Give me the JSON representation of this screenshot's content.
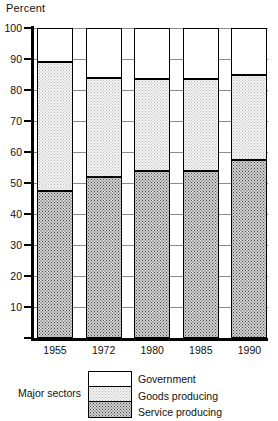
{
  "chart_data": {
    "type": "bar",
    "subtype": "stacked-100-percent",
    "title": "",
    "xlabel": "",
    "ylabel": "Percent",
    "ylim": [
      0,
      100
    ],
    "yticks": [
      0,
      10,
      20,
      30,
      40,
      50,
      60,
      70,
      80,
      90,
      100
    ],
    "ytick_labels": [
      "",
      "10",
      "20",
      "30",
      "40",
      "50",
      "60",
      "70",
      "80",
      "90",
      "100"
    ],
    "grid": true,
    "legend_position": "below",
    "legend_title": "Major sectors",
    "categories": [
      "1955",
      "1972",
      "1980",
      "1985",
      "1990"
    ],
    "series": [
      {
        "name": "Service producing",
        "fill": "dark-stipple",
        "values": [
          47.5,
          52.0,
          54.0,
          54.0,
          57.5
        ]
      },
      {
        "name": "Goods producing",
        "fill": "light-stipple",
        "values": [
          41.5,
          32.0,
          29.5,
          29.5,
          27.5
        ]
      },
      {
        "name": "Government",
        "fill": "white",
        "values": [
          11.0,
          16.0,
          16.5,
          16.5,
          15.0
        ]
      }
    ],
    "segment_tops": {
      "1955": {
        "service": 47.5,
        "goods": 89.0,
        "government": 100
      },
      "1972": {
        "service": 52.0,
        "goods": 84.0,
        "government": 100
      },
      "1980": {
        "service": 54.0,
        "goods": 83.5,
        "government": 100
      },
      "1985": {
        "service": 54.0,
        "goods": 83.5,
        "government": 100
      },
      "1990": {
        "service": 57.5,
        "goods": 85.0,
        "government": 100
      }
    },
    "colors": {
      "government": "#ffffff",
      "goods_producing": "#f3f3f3",
      "service_producing": "#d2d2d2",
      "axis": "#000000",
      "gridline": "#8c8c8c"
    }
  },
  "axis": {
    "y_title": "Percent"
  },
  "legend": {
    "title": "Major sectors",
    "entries": [
      {
        "label": "Government"
      },
      {
        "label": "Goods producing"
      },
      {
        "label": "Service producing"
      }
    ]
  }
}
